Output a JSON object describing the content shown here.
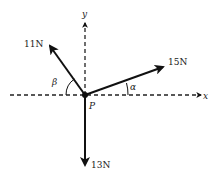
{
  "diagram": {
    "origin": {
      "label": "P",
      "x": 85,
      "y": 95
    },
    "axes": {
      "x": {
        "label": "x",
        "style": "dashed"
      },
      "y": {
        "label": "y",
        "style": "dashed"
      }
    },
    "forces": [
      {
        "id": "f11",
        "label": "11N",
        "magnitude": 11,
        "unit": "N",
        "direction": "up-left"
      },
      {
        "id": "f15",
        "label": "15N",
        "magnitude": 15,
        "unit": "N",
        "direction": "up-right"
      },
      {
        "id": "f13",
        "label": "13N",
        "magnitude": 13,
        "unit": "N",
        "direction": "down"
      }
    ],
    "angles": [
      {
        "label": "β",
        "between": [
          "negative x-axis",
          "11N"
        ]
      },
      {
        "label": "α",
        "between": [
          "positive x-axis",
          "15N"
        ]
      }
    ],
    "colors": {
      "line": "#111111",
      "background": "#ffffff"
    }
  }
}
